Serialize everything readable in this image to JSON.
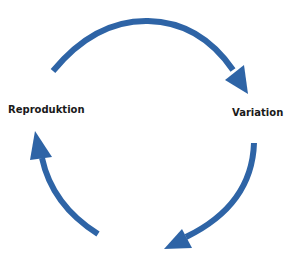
{
  "diagram": {
    "type": "cycle",
    "arrow_color": "#2E64A6",
    "nodes": [
      {
        "id": "reproduktion",
        "label": "Reproduktion",
        "position": "left"
      },
      {
        "id": "variation",
        "label": "Variation",
        "position": "right"
      }
    ],
    "arrows": [
      {
        "id": "top-arrow",
        "from": "reproduktion",
        "to": "variation",
        "direction": "clockwise"
      },
      {
        "id": "bottom-right-arrow",
        "from": "variation",
        "to": "bottom",
        "direction": "clockwise"
      },
      {
        "id": "bottom-left-arrow",
        "from": "bottom",
        "to": "reproduktion",
        "direction": "clockwise"
      }
    ]
  }
}
